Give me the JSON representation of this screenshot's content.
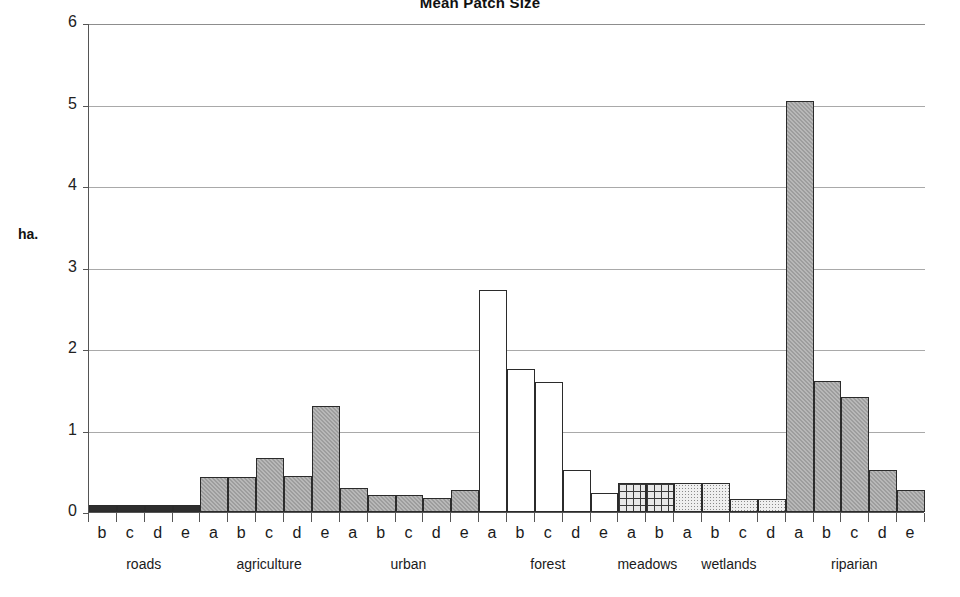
{
  "chart_data": {
    "type": "bar",
    "title": "Mean Patch Size",
    "xlabel": "",
    "ylabel": "ha.",
    "ylim": [
      0,
      6
    ],
    "ytick_labels": [
      "0",
      "1",
      "2",
      "3",
      "4",
      "5",
      "6"
    ],
    "yticks": [
      0,
      1,
      2,
      3,
      4,
      5,
      6
    ],
    "grid": true,
    "legend": "none",
    "groups": [
      {
        "name": "roads",
        "fill": "black",
        "categories": [
          "b",
          "c",
          "d",
          "e"
        ],
        "values": [
          0.09,
          0.09,
          0.09,
          0.09
        ]
      },
      {
        "name": "agriculture",
        "fill": "gray",
        "categories": [
          "a",
          "b",
          "c",
          "d",
          "e"
        ],
        "values": [
          0.43,
          0.43,
          0.66,
          0.44,
          1.3
        ]
      },
      {
        "name": "urban",
        "fill": "gray",
        "categories": [
          "a",
          "b",
          "c",
          "d",
          "e"
        ],
        "values": [
          0.3,
          0.21,
          0.21,
          0.17,
          0.27
        ]
      },
      {
        "name": "forest",
        "fill": "white",
        "categories": [
          "a",
          "b",
          "c",
          "d",
          "e"
        ],
        "values": [
          2.72,
          1.75,
          1.6,
          0.51,
          0.23
        ]
      },
      {
        "name": "meadows",
        "fill": "grid",
        "categories": [
          "a",
          "b"
        ],
        "values": [
          0.36,
          0.36
        ]
      },
      {
        "name": "wetlands",
        "fill": "dots",
        "categories": [
          "a",
          "b",
          "c",
          "d"
        ],
        "values": [
          0.36,
          0.36,
          0.16,
          0.16
        ]
      },
      {
        "name": "riparian",
        "fill": "gray",
        "categories": [
          "a",
          "b",
          "c",
          "d",
          "e"
        ],
        "values": [
          5.04,
          1.61,
          1.41,
          0.51,
          0.27
        ]
      }
    ]
  }
}
